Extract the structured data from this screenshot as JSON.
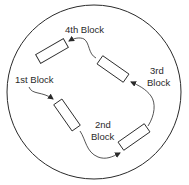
{
  "diagram": {
    "type": "sequence",
    "colors": {
      "stroke": "#2a2a2a",
      "background": "#ffffff",
      "block_fill": "#ffffff"
    },
    "blocks": [
      {
        "id": "block-1",
        "label_line1": "1st Block",
        "label_line2": ""
      },
      {
        "id": "block-2",
        "label_line1": "2nd",
        "label_line2": "Block"
      },
      {
        "id": "block-3",
        "label_line1": "3rd",
        "label_line2": "Block"
      },
      {
        "id": "block-4",
        "label_line1": "4th Block",
        "label_line2": ""
      }
    ],
    "edges": [
      {
        "from": "label-1",
        "to": "block-1"
      },
      {
        "from": "block-1",
        "to": "block-2"
      },
      {
        "from": "block-2",
        "to": "block-3"
      },
      {
        "from": "block-3",
        "to": "block-4"
      }
    ]
  }
}
